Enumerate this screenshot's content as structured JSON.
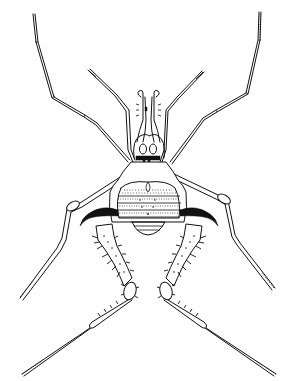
{
  "image": {
    "subject": "Line drawing of a harvestman (Opiliones) in dorsal view",
    "style": "black ink on white",
    "colors": {
      "ink": "#111111",
      "background": "#ffffff"
    }
  },
  "parts": {
    "legs": [
      "leg-I-left",
      "leg-I-right",
      "leg-II-left",
      "leg-II-right",
      "leg-III-left",
      "leg-III-right",
      "leg-IV-left",
      "leg-IV-right"
    ],
    "body": [
      "chelicerae",
      "pedipalps",
      "eye-mound",
      "scutum",
      "hooked-coxal-apophyses",
      "spiny-hind-femora"
    ]
  }
}
